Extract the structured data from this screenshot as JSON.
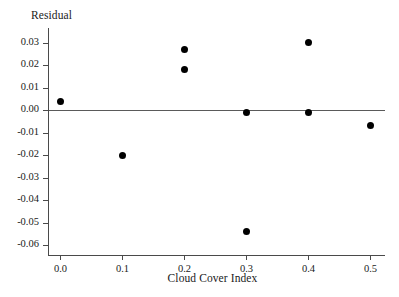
{
  "chart_data": {
    "type": "scatter",
    "title": "",
    "ylabel": "Residual",
    "xlabel": "Cloud Cover Index",
    "xlim": [
      -0.04,
      0.545
    ],
    "ylim": [
      -0.06,
      0.036
    ],
    "grid": false,
    "legend": null,
    "reference_line": {
      "y": 0.0,
      "style": "solid",
      "color": "#5a5a5a"
    },
    "marker": {
      "shape": "circle",
      "color": "#000000",
      "size": 7
    },
    "xticks": [
      0.0,
      0.1,
      0.2,
      0.3,
      0.4,
      0.5
    ],
    "xtick_labels": [
      "0.0",
      "0.1",
      "0.2",
      "0.3",
      "0.4",
      "0.5"
    ],
    "yticks": [
      0.03,
      0.02,
      0.01,
      0.0,
      -0.01,
      -0.02,
      -0.03,
      -0.04,
      -0.05,
      -0.06
    ],
    "ytick_labels": [
      "0.03",
      "0.02",
      "0.01",
      "0.00",
      "-0.01",
      "-0.02",
      "-0.03",
      "-0.04",
      "-0.05",
      "-0.06"
    ],
    "x": [
      0.0,
      0.1,
      0.2,
      0.2,
      0.3,
      0.3,
      0.4,
      0.4,
      0.5
    ],
    "y": [
      0.004,
      -0.02,
      0.027,
      0.018,
      -0.001,
      -0.054,
      0.03,
      -0.001,
      -0.007
    ],
    "points": [
      {
        "x": 0.0,
        "y": 0.004
      },
      {
        "x": 0.1,
        "y": -0.02
      },
      {
        "x": 0.2,
        "y": 0.027
      },
      {
        "x": 0.2,
        "y": 0.018
      },
      {
        "x": 0.3,
        "y": -0.001
      },
      {
        "x": 0.3,
        "y": -0.054
      },
      {
        "x": 0.4,
        "y": 0.03
      },
      {
        "x": 0.4,
        "y": -0.001
      },
      {
        "x": 0.5,
        "y": -0.007
      }
    ]
  },
  "colors": {
    "background": "#ffffff",
    "axis": "#4a4a4a",
    "marker": "#000000",
    "text": "#1a1a1a"
  }
}
